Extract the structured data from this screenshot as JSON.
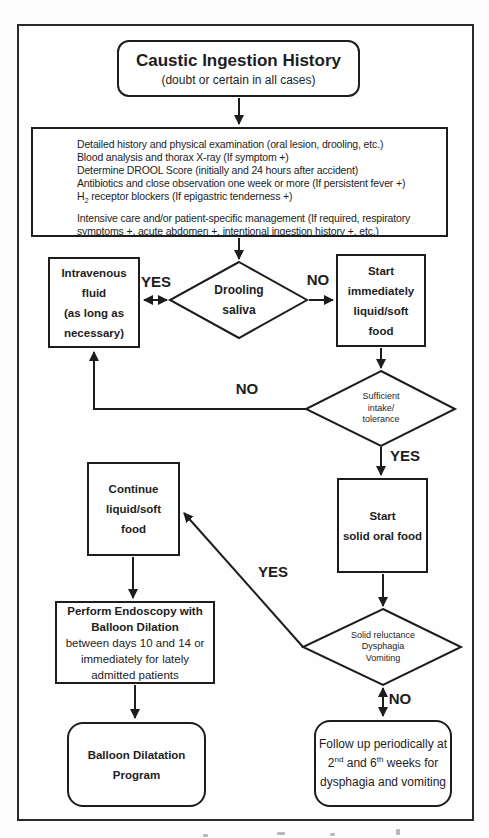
{
  "diagram": {
    "title": "Caustic Ingestion History",
    "subtitle": "(doubt or certain in all cases)"
  },
  "protocol": {
    "lines": [
      "Detailed history and physical examination (oral lesion, drooling, etc.)",
      "Blood analysis and thorax X-ray (If symptom +)",
      "Determine DROOL Score (initially and 24 hours after accident)",
      "Antibiotics and close observation one week or more (If persistent fever +)"
    ],
    "h2": {
      "pre": "H",
      "sub": "2",
      "post": " receptor blockers (If epigastric tenderness +)"
    },
    "intensive": "Intensive care and/or patient-specific management (If required, respiratory\nsymptoms +, acute abdomen +, intentional ingestion history +, etc.)"
  },
  "nodes": {
    "intravenous": "Intravenous\nfluid\n(as long as\nnecessary)",
    "drooling": "Drooling\nsaliva",
    "start_liquid": "Start\nimmediately\nliquid/soft\nfood",
    "sufficient": "Sufficient\nintake/\ntolerance",
    "start_solid": "Start\nsolid oral food",
    "continue_liquid": "Continue\nliquid/soft\nfood",
    "endoscopy_bold": "Perform Endoscopy with\nBalloon Dilation",
    "endoscopy_rest": "between days 10 and 14 or\nimmediately for lately\nadmitted patients",
    "solid_reluctance": "Solid reluctance\nDysphagia\nVomiting",
    "balloon_program": "Balloon Dilatation\nProgram",
    "followup": {
      "line1": "Follow up periodically at",
      "l2_num1": "2",
      "l2_sup1": "nd",
      "l2_mid": " and 6",
      "l2_sup2": "th",
      "l2_end": " weeks for",
      "line3": "dysphagia and vomiting"
    }
  },
  "labels": {
    "yes_drooling": "YES",
    "no_drooling": "NO",
    "no_sufficient": "NO",
    "yes_sufficient": "YES",
    "yes_reluctance": "YES",
    "no_reluctance": "NO"
  },
  "colors": {
    "ink": "#1d1d1d",
    "frame": "#2a2a2a",
    "background": "#ffffff"
  }
}
